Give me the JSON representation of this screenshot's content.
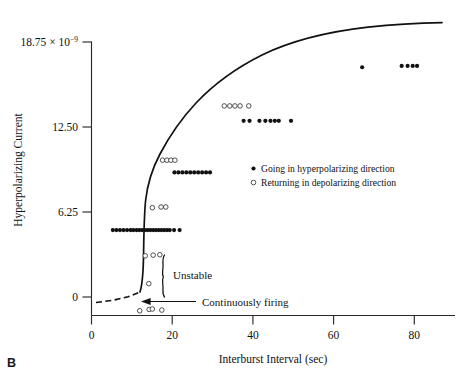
{
  "panel": {
    "label": "B"
  },
  "chart_data": {
    "type": "scatter",
    "title": "",
    "xlabel": "Interburst Interval (sec)",
    "ylabel": "Hyperpolarizing Current",
    "ylabel_units_mantissa": "18.75 × 10",
    "ylabel_units_exponent": "−9",
    "xlim": [
      0,
      92
    ],
    "ylim": [
      0,
      20.2
    ],
    "xticks": [
      0,
      20,
      40,
      60,
      80
    ],
    "xtick_labels": [
      "0",
      "20",
      "40",
      "60",
      "80"
    ],
    "yticks": [
      0,
      6.25,
      12.5,
      18.75
    ],
    "ytick_labels": [
      "0",
      "6.25",
      "12.50",
      "18.75 × 10"
    ],
    "grid": false,
    "legend_position": "center-right",
    "legend": [
      {
        "marker": "filled-circle",
        "label": "Going in hyperpolarizing direction"
      },
      {
        "marker": "open-circle",
        "label": "Returning in depolarizing direction"
      }
    ],
    "annotations": [
      {
        "name": "unstable",
        "text": "Unstable"
      },
      {
        "name": "continuously-firing",
        "text": "Continuously firing"
      }
    ],
    "series": [
      {
        "name": "Going in hyperpolarizing direction",
        "marker": "filled-circle",
        "points": [
          [
            11.4,
            6.3
          ],
          [
            12.1,
            6.3
          ],
          [
            12.8,
            6.3
          ],
          [
            13.5,
            6.3
          ],
          [
            14.2,
            6.3
          ],
          [
            14.9,
            6.3
          ],
          [
            15.6,
            6.3
          ],
          [
            16.3,
            6.3
          ],
          [
            17.0,
            6.3
          ],
          [
            17.7,
            6.3
          ],
          [
            18.4,
            6.3
          ],
          [
            19.1,
            6.3
          ],
          [
            19.8,
            6.3
          ],
          [
            20.9,
            6.3
          ],
          [
            22.3,
            6.3
          ],
          [
            5.4,
            6.3
          ],
          [
            6.3,
            6.3
          ],
          [
            7.2,
            6.3
          ],
          [
            8.1,
            6.3
          ],
          [
            9.0,
            6.3
          ],
          [
            9.9,
            6.3
          ],
          [
            10.6,
            6.3
          ],
          [
            21.0,
            10.55
          ],
          [
            22.0,
            10.55
          ],
          [
            23.0,
            10.55
          ],
          [
            24.0,
            10.55
          ],
          [
            25.0,
            10.55
          ],
          [
            26.0,
            10.55
          ],
          [
            27.0,
            10.55
          ],
          [
            28.0,
            10.55
          ],
          [
            29.0,
            10.55
          ],
          [
            30.0,
            10.55
          ],
          [
            38.5,
            14.35
          ],
          [
            40.0,
            14.35
          ],
          [
            42.5,
            14.35
          ],
          [
            44.0,
            14.35
          ],
          [
            45.3,
            14.35
          ],
          [
            46.4,
            14.35
          ],
          [
            47.4,
            14.35
          ],
          [
            50.5,
            14.35
          ],
          [
            68.5,
            18.3
          ],
          [
            78.5,
            18.4
          ],
          [
            80.0,
            18.4
          ],
          [
            81.3,
            18.4
          ],
          [
            82.4,
            18.4
          ]
        ]
      },
      {
        "name": "Returning in depolarizing direction",
        "marker": "open-circle",
        "points": [
          [
            12.2,
            0.35
          ],
          [
            14.6,
            0.45
          ],
          [
            15.4,
            0.48
          ],
          [
            17.8,
            0.4
          ],
          [
            14.5,
            2.35
          ],
          [
            13.6,
            4.4
          ],
          [
            15.6,
            4.45
          ],
          [
            17.3,
            4.48
          ],
          [
            15.4,
            7.95
          ],
          [
            17.6,
            8.0
          ],
          [
            18.8,
            8.0
          ],
          [
            18.0,
            11.45
          ],
          [
            19.1,
            11.45
          ],
          [
            20.1,
            11.45
          ],
          [
            21.1,
            11.45
          ],
          [
            33.6,
            15.45
          ],
          [
            35.0,
            15.45
          ],
          [
            36.3,
            15.45
          ],
          [
            37.6,
            15.45
          ],
          [
            39.8,
            15.45
          ]
        ]
      }
    ],
    "fit_curve": {
      "name": "hysteresis-steady-state-curve",
      "description": "Saturating branch rising steeply near 12-14 sec then leveling toward 18.9"
    }
  }
}
